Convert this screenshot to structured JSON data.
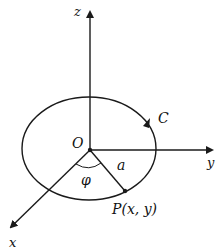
{
  "figure": {
    "colors": {
      "stroke": "#1a1a1a",
      "background": "#ffffff"
    },
    "labels": {
      "z_axis": "z",
      "y_axis": "y",
      "x_axis": "x",
      "origin": "O",
      "curve": "C",
      "radius": "a",
      "angle": "φ",
      "point": "P(x, y)"
    },
    "geometry": {
      "origin": [
        90,
        150
      ],
      "ellipse": {
        "cx": 89,
        "cy": 148.5,
        "rx": 67,
        "ry": 51.5
      },
      "point_P": [
        125,
        191
      ]
    }
  }
}
